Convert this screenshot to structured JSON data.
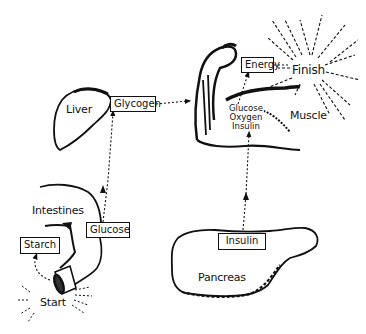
{
  "diagram": {
    "type": "flow-illustration",
    "organs": {
      "liver": "Liver",
      "intestines": "Intestines",
      "pancreas": "Pancreas",
      "muscle": "Muscle"
    },
    "endpoints": {
      "start": "Start",
      "finish": "Finish"
    },
    "boxes": {
      "starch": "Starch",
      "glucose": "Glucose",
      "glycogen": "Glycogen",
      "insulin": "Insulin",
      "energy": "Energy"
    },
    "muscle_inputs": [
      "Glucose",
      "Oxygen",
      "Insulin"
    ],
    "flows": [
      {
        "from": "Start",
        "to": "Starch"
      },
      {
        "from": "Starch",
        "to": "Glucose",
        "via": "Intestines"
      },
      {
        "from": "Glucose",
        "to": "Glycogen",
        "via": "Liver"
      },
      {
        "from": "Glycogen",
        "to": "Muscle"
      },
      {
        "from": "Insulin",
        "to": "Muscle",
        "via": "Pancreas"
      },
      {
        "from": "Muscle",
        "to": "Energy"
      },
      {
        "from": "Energy",
        "to": "Finish"
      }
    ]
  }
}
